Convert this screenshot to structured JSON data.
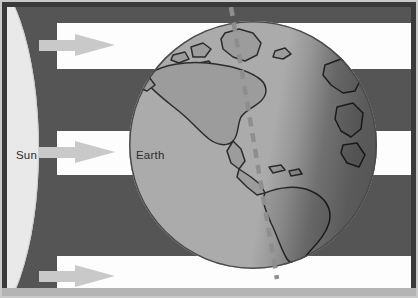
{
  "diagram": {
    "type": "astronomy-illustration",
    "labels": {
      "sun": "Sun",
      "earth": "Earth"
    },
    "bodies": [
      {
        "name": "Sun",
        "shape": "ellipse",
        "position": "left-edge",
        "color": "#e9e9e9",
        "label": "Sun"
      },
      {
        "name": "Earth",
        "shape": "circle",
        "position": "right-of-center",
        "ocean_color": "#ababab",
        "land_color": "#9b9b9b",
        "outline_color": "#2e2e2e",
        "label": "Earth",
        "continents": [
          "North America",
          "South America",
          "Greenland",
          "Europe",
          "Africa"
        ],
        "axis": {
          "style": "dashed",
          "color": "#8d8d8d",
          "tilted": true,
          "description": "rotation axis tilted to the right"
        },
        "terminator": "day side faces the Sun on the left; night side shaded on the right"
      }
    ],
    "light_beams": {
      "count": 3,
      "color": "#fdfdfd",
      "description": "three parallel bands of sunlight travelling from the Sun to the Earth",
      "bands": [
        "top",
        "middle",
        "bottom"
      ]
    },
    "rays": {
      "count": 3,
      "color": "#c9c9c9",
      "direction": "left-to-right",
      "icon": "arrow-right-icon"
    },
    "space_color": "#555555",
    "frame": {
      "border_color": "#3a3a3a",
      "outer_color": "#c9c9c9"
    }
  }
}
